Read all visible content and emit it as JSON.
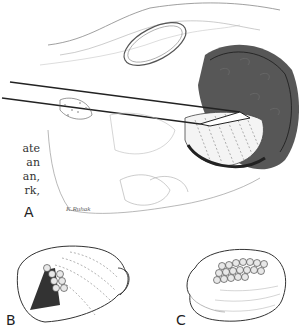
{
  "figure": {
    "caption_fragments": [
      "ate",
      "an",
      "an,",
      "rk,"
    ],
    "panels": [
      {
        "id": "A",
        "label": "A",
        "description": "Surgical retractor/instrument inserted into tissue cavity with dense stippled mass"
      },
      {
        "id": "B",
        "label": "B",
        "description": "Globular structure with dark hatched wedge and stacked circles"
      },
      {
        "id": "C",
        "label": "C",
        "description": "Globular structure with rows of circles across upper portion"
      }
    ],
    "signature": "K.Ruhak",
    "colors": {
      "ink": "#222222",
      "background": "#ffffff"
    }
  }
}
